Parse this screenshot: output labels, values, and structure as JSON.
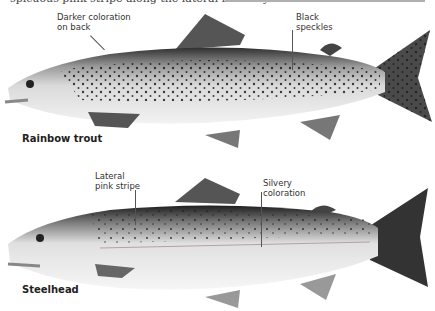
{
  "caption_fragment": "spicuous pink stripe along the lateral line only",
  "fish": [
    {
      "name": "Rainbow trout",
      "labels": [
        {
          "line1": "Darker coloration",
          "line2": "on back"
        },
        {
          "line1": "Black",
          "line2": "speckles"
        }
      ]
    },
    {
      "name": "Steelhead",
      "labels": [
        {
          "line1": "Lateral",
          "line2": "pink stripe"
        },
        {
          "line1": "Silvery",
          "line2": "coloration"
        }
      ]
    }
  ],
  "colors": {
    "body_light": "#e8e8e8",
    "back_dark": "#2a2a2a",
    "fin": "#6a6a6a",
    "speckle": "#1a1a1a",
    "label_text": "#333333"
  }
}
